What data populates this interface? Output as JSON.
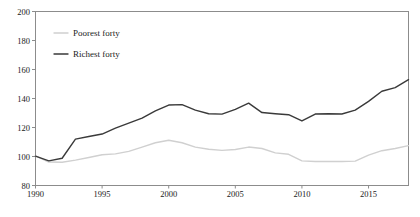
{
  "chart_data": {
    "type": "line",
    "title": "",
    "subtitle": "",
    "xlabel": "",
    "ylabel": "",
    "xlim": [
      1990,
      2018
    ],
    "ylim": [
      80,
      200
    ],
    "grid": false,
    "legend_position": "top-left",
    "x": [
      1990,
      1991,
      1992,
      1993,
      1994,
      1995,
      1996,
      1997,
      1998,
      1999,
      2000,
      2001,
      2002,
      2003,
      2004,
      2005,
      2006,
      2007,
      2008,
      2009,
      2010,
      2011,
      2012,
      2013,
      2014,
      2015,
      2016,
      2017,
      2018
    ],
    "xticks": [
      1990,
      1995,
      2000,
      2005,
      2010,
      2015
    ],
    "xtick_labels": [
      "1990",
      "1995",
      "2000",
      "2005",
      "2010",
      "2015"
    ],
    "yticks": [
      80,
      100,
      120,
      140,
      160,
      180,
      200
    ],
    "ytick_labels": [
      "80",
      "100",
      "120",
      "140",
      "160",
      "180",
      "200"
    ],
    "series": [
      {
        "name": "Poorest forty",
        "color": "#d0d0d0",
        "width": 1.4,
        "values": [
          100.5,
          96.2,
          96.0,
          97.5,
          99.3,
          101.2,
          101.8,
          103.5,
          106.5,
          109.5,
          111.2,
          109.5,
          106.5,
          105.0,
          104.2,
          104.8,
          106.5,
          105.5,
          102.5,
          101.5,
          97.0,
          96.5,
          96.5,
          96.5,
          96.8,
          101.0,
          104.0,
          105.5,
          107.5
        ]
      },
      {
        "name": "Richest forty",
        "color": "#3a3a3a",
        "width": 1.4,
        "values": [
          100.3,
          97.0,
          98.8,
          112.0,
          113.8,
          115.5,
          119.5,
          123.0,
          126.5,
          131.5,
          135.5,
          135.8,
          132.0,
          129.5,
          129.2,
          132.5,
          136.8,
          130.3,
          129.5,
          128.8,
          124.5,
          129.3,
          129.5,
          129.3,
          132.0,
          138.0,
          145.0,
          147.5,
          153.0
        ]
      }
    ]
  },
  "legend": {
    "items": [
      {
        "label": "Poorest forty",
        "color": "#d0d0d0"
      },
      {
        "label": "Richest forty",
        "color": "#3a3a3a"
      }
    ]
  },
  "axes": {
    "y_top_label": "200",
    "y_bottom_label": "80",
    "x_first_label": "1990",
    "x_last_label": "2015"
  }
}
